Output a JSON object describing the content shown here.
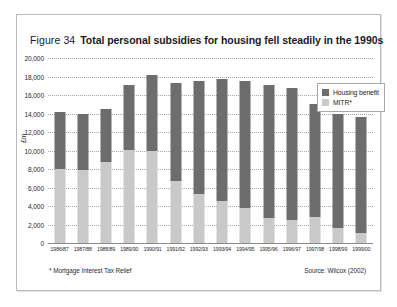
{
  "figure": {
    "number_label": "Figure 34",
    "title": "Total personal subsidies for housing fell steadily in the 1990s",
    "footnote": "* Mortgage Interest Tax Relief",
    "source": "Source: Wilcox (2002)"
  },
  "legend": {
    "position": "top-right",
    "items": [
      {
        "label": "Housing benefit",
        "color": "#6d6d6d"
      },
      {
        "label": "MITR*",
        "color": "#c9c9c9"
      }
    ]
  },
  "colors": {
    "housing_benefit": "#6d6d6d",
    "mitr": "#c9c9c9",
    "gridline": "#9aa8bb",
    "axis": "#8a8a8a",
    "frame_border": "#b9b9b9",
    "text": "#1b1b1b"
  },
  "chart_data": {
    "type": "bar",
    "stacked": true,
    "title": "Total personal subsidies for housing fell steadily in the 1990s",
    "xlabel": "",
    "ylabel": "£m",
    "ylim": [
      0,
      20000
    ],
    "ytick_step": 2000,
    "ytick_labels": [
      "0",
      "2,000",
      "4,000",
      "6,000",
      "8,000",
      "10,000",
      "12,000",
      "14,000",
      "16,000",
      "18,000",
      "20,000"
    ],
    "ytick_values": [
      0,
      2000,
      4000,
      6000,
      8000,
      10000,
      12000,
      14000,
      16000,
      18000,
      20000
    ],
    "grid": true,
    "legend_position": "upper right",
    "categories": [
      "1986/87",
      "1987/88",
      "1988/89",
      "1989/90",
      "1990/91",
      "1991/92",
      "1992/93",
      "1993/94",
      "1994/95",
      "1995/96",
      "1996/97",
      "1997/98",
      "1998/99",
      "1999/00"
    ],
    "series": [
      {
        "name": "MITR*",
        "color": "#c9c9c9",
        "stack_order": "bottom",
        "values": [
          8000,
          7900,
          8700,
          10000,
          9900,
          6700,
          5300,
          4500,
          3800,
          2700,
          2500,
          2800,
          1600,
          1100
        ]
      },
      {
        "name": "Housing benefit",
        "color": "#6d6d6d",
        "stack_order": "top",
        "values": [
          6100,
          6000,
          5700,
          7000,
          8200,
          10500,
          12100,
          13100,
          13600,
          14300,
          14200,
          12200,
          12300,
          12500
        ]
      }
    ],
    "totals": [
      14100,
      13900,
      14400,
      17000,
      18100,
      17200,
      17400,
      17600,
      17400,
      17000,
      16700,
      15000,
      13900,
      13600
    ]
  }
}
